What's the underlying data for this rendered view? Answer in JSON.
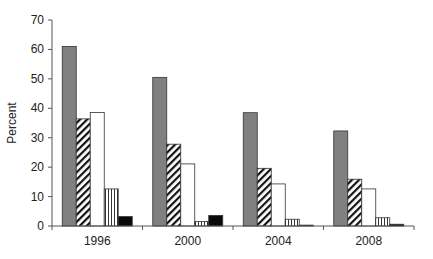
{
  "chart_data": {
    "type": "bar",
    "title": "",
    "xlabel": "",
    "ylabel": "Percent",
    "ylim": [
      0,
      70
    ],
    "yticks": [
      0,
      10,
      20,
      30,
      40,
      50,
      60,
      70
    ],
    "grid": false,
    "legend": null,
    "categories": [
      "1996",
      "2000",
      "2004",
      "2008"
    ],
    "series": [
      {
        "name": "Series 1 (solid gray)",
        "pattern": "solid-gray",
        "color": "#808080",
        "values": [
          61,
          50.5,
          38.5,
          32.3
        ]
      },
      {
        "name": "Series 2 (diagonal hatch)",
        "pattern": "diagonal-hatch",
        "color": "#000000",
        "values": [
          36.4,
          27.8,
          19.6,
          15.9
        ]
      },
      {
        "name": "Series 3 (white)",
        "pattern": "white",
        "color": "#ffffff",
        "values": [
          38.6,
          21.1,
          14.3,
          12.6
        ]
      },
      {
        "name": "Series 4 (vertical lines)",
        "pattern": "vertical-lines",
        "color": "#000000",
        "values": [
          12.6,
          1.5,
          2.3,
          2.8
        ]
      },
      {
        "name": "Series 5 (solid black)",
        "pattern": "solid-black",
        "color": "#000000",
        "values": [
          3.2,
          3.6,
          0.3,
          0.6
        ]
      }
    ]
  }
}
